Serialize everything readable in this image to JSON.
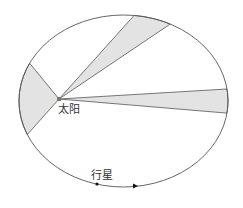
{
  "diagram": {
    "title": "",
    "labels": {
      "sun": "太阳",
      "planet": "行星"
    },
    "colors": {
      "orbit_stroke": "#555555",
      "sector_fill": "#e3e3e3",
      "sector_stroke": "#555555",
      "background": "#ffffff"
    },
    "ellipse": {
      "cx": 123.5,
      "cy": 101,
      "rx": 104.5,
      "ry": 86
    },
    "sun": {
      "x": 59,
      "y": 99
    },
    "sectors": [
      {
        "name": "left-sector",
        "p1": [
          29,
          63
        ],
        "p2": [
          26,
          135
        ]
      },
      {
        "name": "top-sector",
        "p1": [
          134,
          16
        ],
        "p2": [
          169,
          26
        ]
      },
      {
        "name": "right-sector",
        "p1": [
          227,
          89
        ],
        "p2": [
          226,
          113
        ]
      }
    ],
    "planet": {
      "x": 97,
      "y": 184
    },
    "direction_arrow": {
      "x": 135,
      "y": 186
    }
  }
}
